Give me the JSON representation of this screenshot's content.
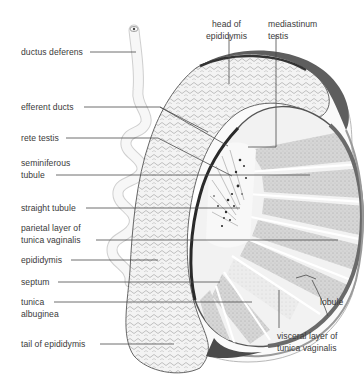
{
  "diagram": {
    "colors": {
      "line": "#4a4a4a",
      "text": "#3a3a3a",
      "outline": "#555555",
      "light_fill": "#f4f4f4",
      "lobule_fill": "#d8d8d8",
      "dark_rim": "#5a5a5a"
    },
    "labels_left": [
      {
        "id": "ductus-deferens",
        "lines": [
          "ductus deferens"
        ]
      },
      {
        "id": "efferent-ducts",
        "lines": [
          "efferent ducts"
        ]
      },
      {
        "id": "rete-testis",
        "lines": [
          "rete testis"
        ]
      },
      {
        "id": "seminiferous-tubule",
        "lines": [
          "seminiferous",
          "tubule"
        ]
      },
      {
        "id": "straight-tubule",
        "lines": [
          "straight tubule"
        ]
      },
      {
        "id": "parietal-layer",
        "lines": [
          "parietal layer of",
          "tunica vaginalis"
        ]
      },
      {
        "id": "epididymis",
        "lines": [
          "epididymis"
        ]
      },
      {
        "id": "septum",
        "lines": [
          "septum"
        ]
      },
      {
        "id": "tunica-albuginea",
        "lines": [
          "tunica",
          "albuginea"
        ]
      },
      {
        "id": "tail-of-epididymis",
        "lines": [
          "tail of epididymis"
        ]
      }
    ],
    "labels_top": [
      {
        "id": "head-of-epididymis",
        "lines": [
          "head of",
          "epididymis"
        ]
      },
      {
        "id": "mediastinum-testis",
        "lines": [
          "mediastinum",
          "testis"
        ]
      }
    ],
    "labels_right": [
      {
        "id": "lobule",
        "lines": [
          "lobule"
        ]
      },
      {
        "id": "visceral-layer",
        "lines": [
          "visceral layer of",
          "tunica vaginalis"
        ]
      }
    ]
  }
}
